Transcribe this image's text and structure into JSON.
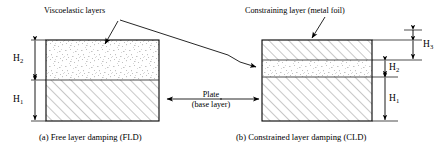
{
  "figure": {
    "labels": {
      "viscoelastic": "Viscoelastic layers",
      "constraining": "Constraining layer (metal foil)",
      "plate_line1": "Plate",
      "plate_line2": "(base layer)"
    },
    "captions": {
      "left": "(a) Free layer damping (FLD)",
      "right": "(b) Constrained layer damping (CLD)"
    },
    "dimensions": {
      "fld": [
        {
          "name": "H2",
          "base": "H",
          "sub": "2",
          "layer": "viscoelastic"
        },
        {
          "name": "H1",
          "base": "H",
          "sub": "1",
          "layer": "base-plate"
        }
      ],
      "cld": [
        {
          "name": "H3",
          "base": "H",
          "sub": "3",
          "layer": "constraining"
        },
        {
          "name": "H2",
          "base": "H",
          "sub": "2",
          "layer": "viscoelastic"
        },
        {
          "name": "H1",
          "base": "H",
          "sub": "1",
          "layer": "base-plate"
        }
      ]
    },
    "colors": {
      "outline": "#000000",
      "hatch": "#9a9a9a",
      "stipple": "#b9b9b9",
      "divider": "#555555",
      "text": "#000000",
      "background": "#ffffff"
    }
  }
}
